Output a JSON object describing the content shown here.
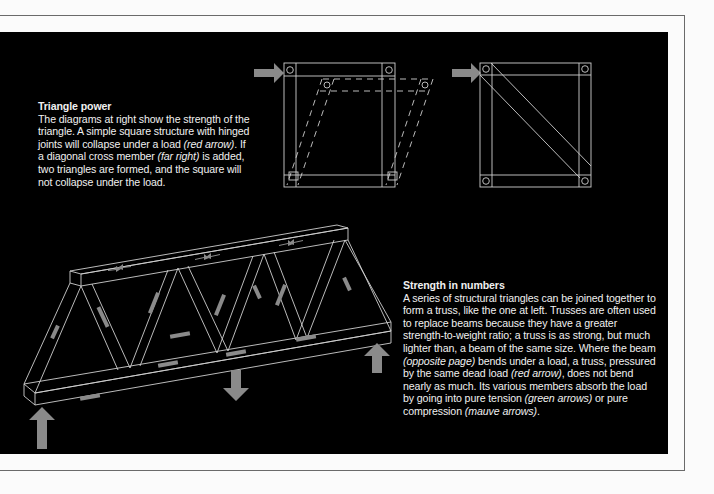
{
  "page": {
    "background_color": "#fbfbfb",
    "panel_color": "#000000",
    "line_color": "#cfcfcf",
    "arrow_color": "#8a8a8a"
  },
  "triangle_power": {
    "title": "Triangle power",
    "body_parts": [
      "The diagrams at right show the strength of the triangle. A simple square structure with hinged joints will collapse under a load ",
      "(red arrow)",
      ". If a diagonal cross member ",
      "(far right)",
      " is added, two triangles are formed, and the square will not collapse under the load."
    ]
  },
  "strength_in_numbers": {
    "title": "Strength in numbers",
    "body_parts": [
      "A series of structural triangles can be joined together to form a truss, like the one at left. Trusses are often used to replace beams because they have a greater strength-to-weight ratio; a truss is as strong, but much lighter than, a beam of the same size. Where the beam ",
      "(opposite page)",
      " bends under a load, a truss, pressured by the same dead load ",
      "(red arrow)",
      ", does not bend nearly as much. Its various members absorb the load by going into pure tension ",
      "(green arrows)",
      " or pure compression ",
      "(mauve arrows)",
      "."
    ]
  },
  "diagrams": {
    "hinged_square": {
      "icon": "collapsing-hinged-square-diagram",
      "load_arrow": "right-arrow"
    },
    "braced_square": {
      "icon": "diagonally-braced-square-diagram",
      "load_arrow": "right-arrow"
    },
    "truss": {
      "icon": "triangular-truss-diagram",
      "supports": [
        "up-arrow-left",
        "up-arrow-right"
      ],
      "load": "down-arrow-center"
    }
  }
}
